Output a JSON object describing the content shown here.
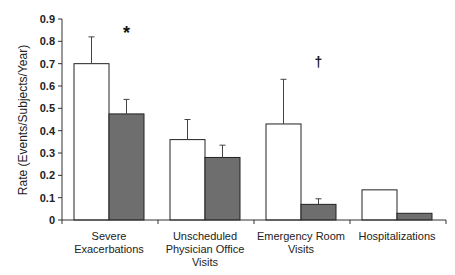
{
  "chart_data": {
    "type": "bar",
    "title": "",
    "xlabel": "",
    "ylabel": "Rate (Events/Subjects/Year)",
    "ylim": [
      0,
      0.9
    ],
    "yticks": [
      0,
      0.1,
      0.2,
      0.3,
      0.4,
      0.5,
      0.6,
      0.7,
      0.8,
      0.9
    ],
    "ytick_labels": [
      "0",
      "0.1",
      "0.2",
      "0.3",
      "0.4",
      "0.5",
      "0.6",
      "0.7",
      "0.8",
      "0.9"
    ],
    "grid": false,
    "legend": null,
    "categories": [
      [
        "Severe",
        "Exacerbations"
      ],
      [
        "Unscheduled",
        "Physician Office",
        "Visits"
      ],
      [
        "Emergency Room",
        "Visits"
      ],
      [
        "Hospitalizations"
      ]
    ],
    "series": [
      {
        "name": "Group 1 (white)",
        "color": "#ffffff",
        "values": [
          0.7,
          0.36,
          0.43,
          0.135
        ],
        "error_upper": [
          0.82,
          0.45,
          0.63,
          null
        ]
      },
      {
        "name": "Group 2 (gray)",
        "color": "#6e6e6e",
        "values": [
          0.475,
          0.28,
          0.07,
          0.03
        ],
        "error_upper": [
          0.54,
          0.335,
          0.095,
          null
        ]
      }
    ],
    "annotations": [
      {
        "text": "*",
        "category_index": 0,
        "y": 0.855
      },
      {
        "text": "†",
        "category_index": 2,
        "y": 0.71
      }
    ]
  }
}
